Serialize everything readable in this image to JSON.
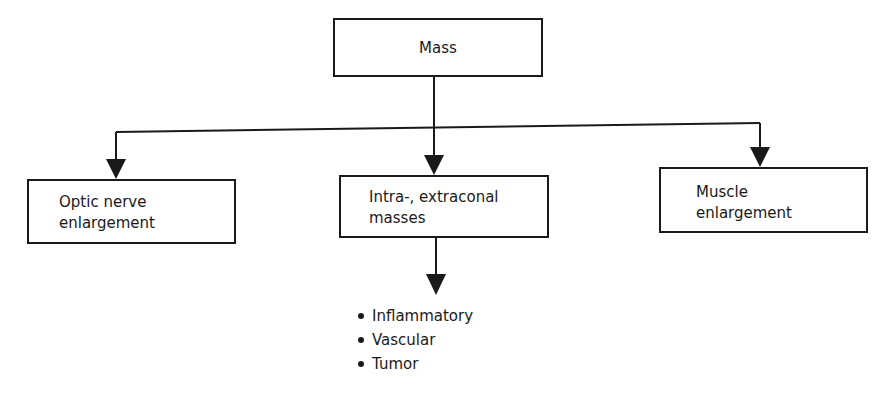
{
  "diagram": {
    "root": {
      "label": "Mass"
    },
    "children": [
      {
        "id": "optic",
        "lines": [
          "Optic nerve",
          "enlargement"
        ]
      },
      {
        "id": "intra",
        "lines": [
          "Intra-, extraconal",
          "masses"
        ]
      },
      {
        "id": "muscle",
        "lines": [
          "Muscle",
          "enlargement"
        ]
      }
    ],
    "intra_subtypes": [
      "Inflammatory",
      "Vascular",
      "Tumor"
    ],
    "colors": {
      "stroke": "#1a1a1a",
      "background": "#ffffff"
    }
  }
}
